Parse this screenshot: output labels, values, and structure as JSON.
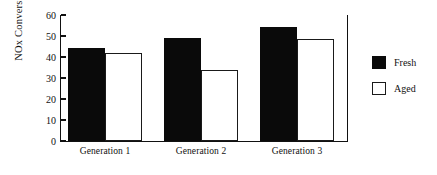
{
  "chart_data": {
    "type": "bar",
    "title": "",
    "xlabel": "",
    "ylabel": "NOx Conversion (%)",
    "categories": [
      "Generation 1",
      "Generation 2",
      "Generation 3"
    ],
    "series": [
      {
        "name": "Fresh",
        "values": [
          44.5,
          49.0,
          54.5
        ],
        "color": "#0a0a0a",
        "style": "filled"
      },
      {
        "name": "Aged",
        "values": [
          42.0,
          34.0,
          48.5
        ],
        "color": "#ffffff",
        "style": "outline"
      }
    ],
    "ylim": [
      0,
      60
    ],
    "yticks": [
      0,
      10,
      20,
      30,
      40,
      50,
      60
    ],
    "ytick_labels": [
      "0",
      "10",
      "20",
      "30",
      "40",
      "50",
      "60"
    ],
    "grid": false,
    "legend_position": "right",
    "legend_entries": [
      "Fresh",
      "Aged"
    ]
  }
}
